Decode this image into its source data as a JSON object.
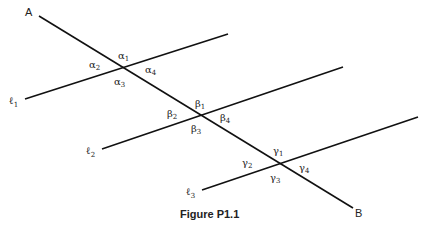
{
  "figure": {
    "caption": "Figure P1.1",
    "transversal": {
      "start_label": "A",
      "end_label": "B"
    },
    "lines": [
      {
        "label": "ℓ",
        "sub": "1"
      },
      {
        "label": "ℓ",
        "sub": "2"
      },
      {
        "label": "ℓ",
        "sub": "3"
      }
    ],
    "angles": {
      "alpha": [
        {
          "g": "α",
          "s": "1"
        },
        {
          "g": "α",
          "s": "2"
        },
        {
          "g": "α",
          "s": "3"
        },
        {
          "g": "α",
          "s": "4"
        }
      ],
      "beta": [
        {
          "g": "β",
          "s": "1"
        },
        {
          "g": "β",
          "s": "2"
        },
        {
          "g": "β",
          "s": "3"
        },
        {
          "g": "β",
          "s": "4"
        }
      ],
      "gamma": [
        {
          "g": "γ",
          "s": "1"
        },
        {
          "g": "γ",
          "s": "2"
        },
        {
          "g": "γ",
          "s": "3"
        },
        {
          "g": "γ",
          "s": "4"
        }
      ]
    }
  }
}
